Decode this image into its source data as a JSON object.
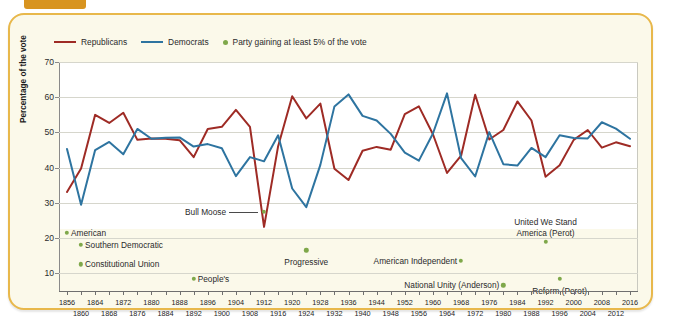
{
  "figure": {
    "frame_color": "#e8b84b",
    "tab_color": "#d8941f",
    "background": "#fbf9ea"
  },
  "legend": {
    "items": [
      {
        "label": "Republicans",
        "marker": "line",
        "color": "#9e2b25",
        "name": "legend-republicans"
      },
      {
        "label": "Democrats",
        "marker": "line",
        "color": "#2e74a0",
        "name": "legend-democrats"
      },
      {
        "label": "Party gaining at least 5% of the vote",
        "marker": "dot",
        "color": "#7fa84a",
        "name": "legend-third-party"
      }
    ]
  },
  "chart_data": {
    "type": "line",
    "title": "",
    "xlabel": "",
    "ylabel": "Percentage of the vote",
    "ylim": [
      5,
      70
    ],
    "yticks": [
      10,
      20,
      30,
      40,
      50,
      60,
      70
    ],
    "grid": true,
    "legend_position": "top-left",
    "x": [
      1856,
      1860,
      1864,
      1868,
      1872,
      1876,
      1880,
      1884,
      1888,
      1892,
      1896,
      1900,
      1904,
      1908,
      1912,
      1916,
      1920,
      1924,
      1928,
      1932,
      1936,
      1940,
      1944,
      1948,
      1952,
      1956,
      1960,
      1964,
      1968,
      1972,
      1976,
      1980,
      1984,
      1988,
      1992,
      1996,
      2000,
      2004,
      2008,
      2012,
      2016
    ],
    "series": [
      {
        "name": "Republicans",
        "color": "#9e2b25",
        "values": [
          33.1,
          39.8,
          55.0,
          52.7,
          55.6,
          47.9,
          48.3,
          48.2,
          47.8,
          43.0,
          51.0,
          51.6,
          56.4,
          51.6,
          23.2,
          46.1,
          60.3,
          54.0,
          58.2,
          39.7,
          36.5,
          44.8,
          45.9,
          45.1,
          55.2,
          57.4,
          49.5,
          38.5,
          43.4,
          60.7,
          48.0,
          50.7,
          58.8,
          53.4,
          37.4,
          40.7,
          47.9,
          50.7,
          45.7,
          47.2,
          46.1
        ]
      },
      {
        "name": "Democrats",
        "color": "#2e74a0",
        "values": [
          45.3,
          29.5,
          45.0,
          47.3,
          43.8,
          51.0,
          48.2,
          48.5,
          48.6,
          46.0,
          46.7,
          45.5,
          37.6,
          43.0,
          41.8,
          49.2,
          34.1,
          28.8,
          40.8,
          57.4,
          60.8,
          54.7,
          53.4,
          49.6,
          44.3,
          42.0,
          49.7,
          61.1,
          42.7,
          37.5,
          50.1,
          41.0,
          40.6,
          45.6,
          43.0,
          49.2,
          48.4,
          48.3,
          52.9,
          51.1,
          48.2
        ]
      }
    ],
    "third_party_points": [
      {
        "label": "American",
        "year": 1856,
        "value": 21.5,
        "label_side": "right",
        "style": "inline"
      },
      {
        "label": "Southern Democratic",
        "year": 1860,
        "value": 18.1,
        "label_side": "right",
        "style": "inline"
      },
      {
        "label": "Constitutional Union",
        "year": 1860,
        "value": 12.6,
        "label_side": "right",
        "style": "inline"
      },
      {
        "label": "People's",
        "year": 1892,
        "value": 8.5,
        "label_side": "right",
        "style": "inline"
      },
      {
        "label": "Bull Moose",
        "year": 1912,
        "value": 27.4,
        "label_side": "left",
        "style": "leader"
      },
      {
        "label": "Progressive",
        "year": 1924,
        "value": 16.6,
        "label_side": "below",
        "style": "below"
      },
      {
        "label": "American Independent",
        "year": 1968,
        "value": 13.5,
        "label_side": "left",
        "style": "inline"
      },
      {
        "label": "National Unity (Anderson)",
        "year": 1980,
        "value": 6.6,
        "label_side": "left",
        "style": "inline"
      },
      {
        "label": "United We Stand America (Perot)",
        "year": 1992,
        "value": 18.9,
        "label_side": "above",
        "style": "above2"
      },
      {
        "label": "Reform (Perot)",
        "year": 1996,
        "value": 8.4,
        "label_side": "below",
        "style": "below"
      }
    ]
  },
  "xaxis": {
    "row_top": [
      1856,
      1864,
      1872,
      1880,
      1888,
      1896,
      1904,
      1912,
      1920,
      1928,
      1936,
      1944,
      1952,
      1960,
      1968,
      1976,
      1984,
      1992,
      2000,
      2008,
      2016
    ],
    "row_bottom": [
      1860,
      1868,
      1876,
      1884,
      1892,
      1900,
      1908,
      1916,
      1924,
      1932,
      1940,
      1948,
      1956,
      1964,
      1972,
      1980,
      1988,
      1996,
      2004,
      2012
    ]
  }
}
